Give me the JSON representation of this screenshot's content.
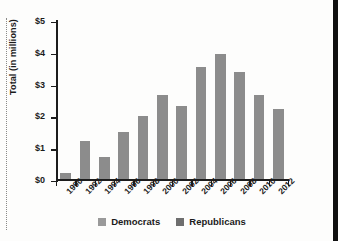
{
  "chart_data": {
    "type": "bar",
    "title": "",
    "subtitle": "",
    "xlabel": "",
    "ylabel": "Total (in millions)",
    "categories": [
      "1990",
      "1992",
      "1994",
      "1996",
      "1998",
      "2000",
      "2002",
      "2004",
      "2006",
      "2008",
      "2010",
      "2012"
    ],
    "values": [
      0.2,
      1.2,
      0.7,
      1.5,
      2.0,
      2.65,
      2.32,
      3.52,
      3.93,
      3.37,
      2.65,
      2.2
    ],
    "series": [
      {
        "name": "Democrats",
        "color": "#8c8c8c",
        "values": [
          0.2,
          1.2,
          0.7,
          1.5,
          2.0,
          2.65,
          2.32,
          3.52,
          3.93,
          3.37,
          2.65,
          2.2
        ]
      }
    ],
    "ylim": [
      0,
      5
    ],
    "ytick_values": [
      0,
      1,
      2,
      3,
      4,
      5
    ],
    "ytick_labels": [
      "$0",
      "$1",
      "$2",
      "$3",
      "$4",
      "$5"
    ],
    "grid": false,
    "legend_position": "bottom",
    "legend": [
      {
        "label": "Democrats",
        "color": "#9a9a9a"
      },
      {
        "label": "Republicans",
        "color": "#6e6e6e"
      }
    ]
  }
}
